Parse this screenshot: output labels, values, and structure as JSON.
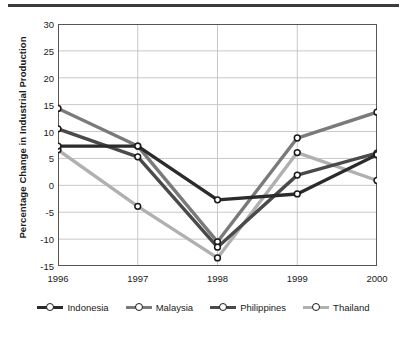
{
  "chart_data": {
    "type": "line",
    "title": "",
    "xlabel": "",
    "ylabel": "Percentage Change in Industrial Production",
    "x": [
      "1996",
      "1997",
      "1998",
      "1999",
      "2000"
    ],
    "categories": [
      "1996",
      "1997",
      "1998",
      "1999",
      "2000"
    ],
    "ylim": [
      -15,
      30
    ],
    "yticks": [
      30,
      25,
      20,
      15,
      10,
      5,
      0,
      -5,
      -10,
      -15
    ],
    "ytick_labels": [
      "30",
      "25",
      "20",
      "15",
      "10",
      "5",
      "0",
      "-5",
      "-10",
      "-15"
    ],
    "grid": true,
    "legend_position": "bottom",
    "series": [
      {
        "name": "Indonesia",
        "color": "#2b2b2b",
        "values": [
          7.3,
          7.3,
          -2.7,
          -1.6,
          5.7
        ]
      },
      {
        "name": "Malaysia",
        "color": "#7a7a7a",
        "values": [
          14.3,
          7.3,
          -10.5,
          8.8,
          13.6
        ]
      },
      {
        "name": "Philippines",
        "color": "#4a4a4a",
        "values": [
          10.5,
          5.3,
          -11.5,
          1.9,
          6.0
        ]
      },
      {
        "name": "Thailand",
        "color": "#b0b0b0",
        "values": [
          6.6,
          -3.9,
          -13.5,
          6.1,
          0.9
        ]
      }
    ]
  },
  "legend": {
    "items": [
      {
        "label": "Indonesia"
      },
      {
        "label": "Malaysia"
      },
      {
        "label": "Philippines"
      },
      {
        "label": "Thailand"
      }
    ]
  },
  "axis": {
    "y_axis_title": "Percentage Change in Industrial Production"
  },
  "colors": {
    "axis": "#555555",
    "grid": "#c8c8c8",
    "text": "#1a1a1a",
    "top_rule": "#3b3b3b",
    "marker_fill": "#ffffff"
  }
}
